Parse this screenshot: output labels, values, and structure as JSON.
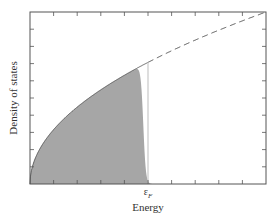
{
  "chart_data": {
    "type": "area",
    "title": "",
    "xlabel": "Energy",
    "ylabel": "Density of states",
    "x_tick_labels": [
      {
        "x": "εF",
        "label": "ε_F"
      }
    ],
    "grid": false,
    "legend": null,
    "series": [
      {
        "name": "Density of states g(ε) ∝ √ε",
        "style": "solid then dashed",
        "description": "sqrt curve from origin; solid up to εF, dashed beyond to top-right corner"
      },
      {
        "name": "Occupied states g(ε)f(ε)",
        "style": "filled gray area",
        "description": "shaded area under sqrt curve, dropping sharply near εF (Fermi-Dirac cutoff)"
      }
    ],
    "x": [
      0,
      0.1,
      0.2,
      0.3,
      0.4,
      0.5,
      0.6,
      0.7,
      0.8,
      0.9,
      1.0
    ],
    "values_dos": [
      0,
      0.32,
      0.45,
      0.55,
      0.63,
      0.71,
      0.77,
      0.84,
      0.89,
      0.95,
      1.0
    ],
    "fermi_energy_fraction": 0.5,
    "annotations": [
      "ε_F vertical line"
    ]
  },
  "labels": {
    "xlabel": "Energy",
    "ylabel": "Density of states",
    "ef_main": "ε",
    "ef_sub": "F"
  },
  "colors": {
    "fill": "#a6a6a6",
    "axis": "#555555",
    "curve": "#444444",
    "fermi_line": "#c8c8c8"
  }
}
